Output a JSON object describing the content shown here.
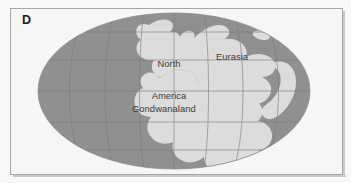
{
  "figure": {
    "panel_letter": "D",
    "background_color": "#f7f7f6",
    "frame_color": "#a5a7a6"
  },
  "map": {
    "projection": "mollweide-ellipse",
    "ocean_color": "#919191",
    "land_color": "#dcdcdc",
    "graticule_color": "#7b7b7b",
    "coastline_color": "#b6b6b4",
    "label_color": "#3a3a3a",
    "graticule": {
      "meridian_count": 7,
      "parallel_count": 5
    },
    "labels": [
      {
        "id": "north-america",
        "line1": "North",
        "line2": "America"
      },
      {
        "id": "eurasia",
        "text": "Eurasia"
      },
      {
        "id": "gondwanaland",
        "text": "Gondwanaland"
      }
    ],
    "north_america": {
      "line1": "North",
      "line2": "America"
    },
    "eurasia": {
      "text": "Eurasia"
    },
    "gondwanaland": {
      "text": "Gondwanaland"
    }
  }
}
